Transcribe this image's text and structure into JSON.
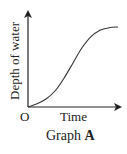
{
  "chart_data": {
    "type": "line",
    "title": "Graph A",
    "xlabel": "Time",
    "ylabel": "Depth of water",
    "origin_label": "O",
    "grid": false,
    "legend": null,
    "ticks": {
      "x": [],
      "y": []
    },
    "series": [
      {
        "name": "Depth of water",
        "shape": "S-shaped (sigmoid) curve: starts at origin, rises slowly, then steeply, then levels off",
        "x": [
          0,
          0.1,
          0.2,
          0.3,
          0.4,
          0.5,
          0.6,
          0.7,
          0.8,
          0.9,
          1.0
        ],
        "values": [
          0,
          0.04,
          0.1,
          0.2,
          0.36,
          0.55,
          0.74,
          0.88,
          0.96,
          0.99,
          1.0
        ]
      }
    ],
    "xlim": [
      0,
      1.0
    ],
    "ylim": [
      0,
      1.0
    ]
  },
  "caption": {
    "prefix": "Graph ",
    "letter": "A"
  }
}
